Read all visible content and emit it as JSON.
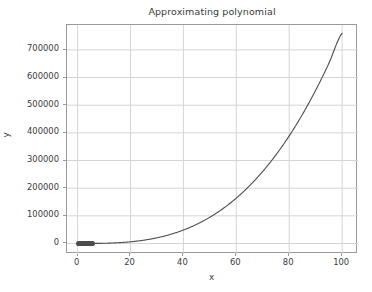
{
  "chart_data": {
    "type": "line",
    "title": "Approximating polynomial",
    "xlabel": "x",
    "ylabel": "y",
    "xlim": [
      -4,
      106
    ],
    "ylim": [
      -38000,
      790000
    ],
    "grid": true,
    "legend": null,
    "xticks": [
      "0",
      "20",
      "40",
      "60",
      "80",
      "100"
    ],
    "xtick_values": [
      0,
      20,
      40,
      60,
      80,
      100
    ],
    "yticks": [
      "0",
      "100000",
      "200000",
      "300000",
      "400000",
      "500000",
      "600000",
      "700000"
    ],
    "ytick_values": [
      0,
      100000,
      200000,
      300000,
      400000,
      500000,
      600000,
      700000
    ],
    "series": [
      {
        "name": "approximating-polynomial-curve",
        "style": "line",
        "color": "#4d4d4d",
        "x": [
          0,
          5,
          10,
          15,
          20,
          25,
          30,
          35,
          40,
          45,
          50,
          55,
          60,
          65,
          70,
          75,
          80,
          85,
          90,
          95,
          100
        ],
        "y": [
          0,
          95,
          760,
          2565,
          6080,
          11875,
          20520,
          32585,
          48640,
          69255,
          95000,
          126445,
          164160,
          208715,
          260680,
          320625,
          389120,
          466735,
          554040,
          651605,
          760000
        ]
      },
      {
        "name": "sample-data-points",
        "style": "markers",
        "color": "#4d4d4d",
        "x": [
          0.4,
          0.8,
          1.2,
          1.6,
          2.0,
          2.4,
          2.8,
          3.2,
          3.6,
          4.0,
          4.4,
          4.8,
          5.2,
          5.6
        ],
        "y": [
          0,
          0,
          0,
          0,
          0,
          0,
          0,
          0,
          0,
          0,
          0,
          0,
          0,
          0
        ]
      }
    ],
    "colors": {
      "line": "#4d4d4d",
      "grid": "#d5d5d5",
      "axis": "#9a9a9a",
      "text": "#3b3b3b",
      "background": "#ffffff"
    }
  }
}
